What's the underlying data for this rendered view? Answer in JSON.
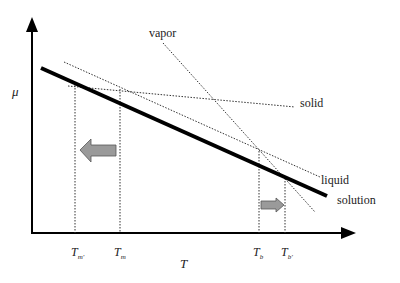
{
  "diagram": {
    "axes": {
      "y_label": "μ",
      "x_label": "T"
    },
    "curves": {
      "vapor": "vapor",
      "solid": "solid",
      "liquid": "liquid",
      "solution": "solution"
    },
    "ticks": {
      "tm_prime": {
        "base": "T",
        "sub": "m'"
      },
      "tm": {
        "base": "T",
        "sub": "m"
      },
      "tb": {
        "base": "T",
        "sub": "b"
      },
      "tb_prime": {
        "base": "T",
        "sub": "b'"
      }
    },
    "arrows": {
      "freezing_shift": "left",
      "boiling_shift": "right"
    },
    "colors": {
      "line": "#000000",
      "arrow_fill": "#9a9a9a",
      "arrow_stroke": "#555555"
    }
  }
}
